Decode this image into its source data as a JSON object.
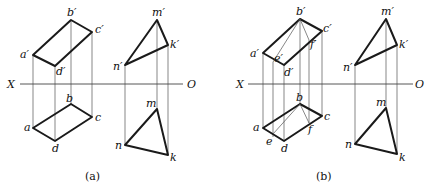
{
  "panels": [
    {
      "id": "a",
      "caption": "(a)",
      "axis": {
        "left": "X",
        "right": "O"
      },
      "upper_labels": {
        "a": "a′",
        "b": "b′",
        "c": "c′",
        "d": "d′",
        "m": "m′",
        "n": "n′",
        "k": "k′"
      },
      "lower_labels": {
        "a": "a",
        "b": "b",
        "c": "c",
        "d": "d",
        "m": "m",
        "n": "n",
        "k": "k"
      }
    },
    {
      "id": "b",
      "caption": "(b)",
      "axis": {
        "left": "X",
        "right": "O"
      },
      "upper_labels": {
        "a": "a′",
        "b": "b′",
        "c": "c′",
        "d": "d′",
        "e": "e′",
        "f": "f′",
        "m": "m′",
        "n": "n′",
        "k": "k′"
      },
      "lower_labels": {
        "a": "a",
        "b": "b",
        "c": "c",
        "d": "d",
        "e": "e",
        "f": "f",
        "m": "m",
        "n": "n",
        "k": "k"
      }
    }
  ]
}
